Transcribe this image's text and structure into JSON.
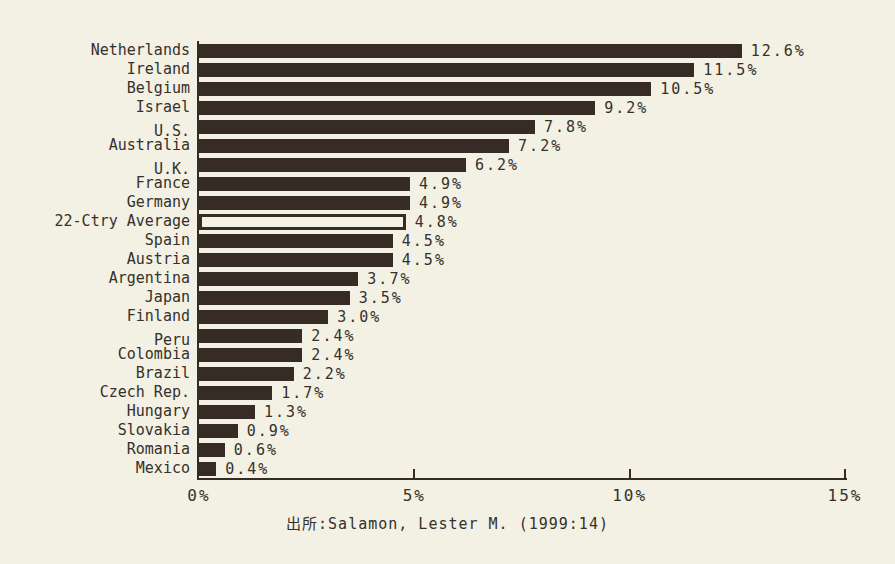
{
  "chart_data": {
    "type": "bar",
    "orientation": "horizontal",
    "title": "",
    "categories": [
      "Netherlands",
      "Ireland",
      "Belgium",
      "Israel",
      "U.S.",
      "Australia",
      "U.K.",
      "France",
      "Germany",
      "22-Ctry Average",
      "Spain",
      "Austria",
      "Argentina",
      "Japan",
      "Finland",
      "Peru",
      "Colombia",
      "Brazil",
      "Czech Rep.",
      "Hungary",
      "Slovakia",
      "Romania",
      "Mexico"
    ],
    "values": [
      12.6,
      11.5,
      10.5,
      9.2,
      7.8,
      7.2,
      6.2,
      4.9,
      4.9,
      4.8,
      4.5,
      4.5,
      3.7,
      3.5,
      3.0,
      2.4,
      2.4,
      2.2,
      1.7,
      1.3,
      0.9,
      0.6,
      0.4
    ],
    "value_labels": [
      "12.6%",
      "11.5%",
      "10.5%",
      "9.2%",
      "7.8%",
      "7.2%",
      "6.2%",
      "4.9%",
      "4.9%",
      "4.8%",
      "4.5%",
      "4.5%",
      "3.7%",
      "3.5%",
      "3.0%",
      "2.4%",
      "2.4%",
      "2.2%",
      "1.7%",
      "1.3%",
      "0.9%",
      "0.6%",
      "0.4%"
    ],
    "highlight_index": 9,
    "highlight_category": "22-Ctry Average",
    "highlight_style": "hollow-outlined-bar",
    "xlim": [
      0,
      15
    ],
    "x_ticks": [
      "0%",
      "5%",
      "10%",
      "15%"
    ],
    "grid": false,
    "legend": "none",
    "caption": "出所:Salamon, Lester M. (1999:14)",
    "colors": {
      "background": "#f3f0e4",
      "bar": "#362b25",
      "highlight_fill": "#f3f0e4",
      "text": "#35312b"
    }
  }
}
